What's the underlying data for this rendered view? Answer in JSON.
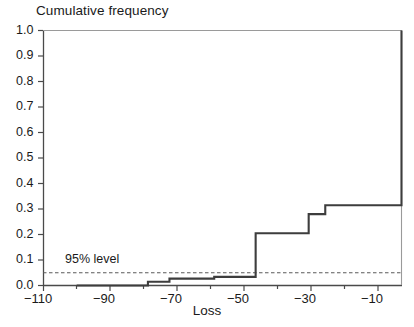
{
  "chart_data": {
    "type": "line",
    "subtype": "step",
    "title": "Cumulative frequency",
    "xlabel": "Loss",
    "ylabel": "Cumulative frequency",
    "xlim": [
      -110,
      -2
    ],
    "ylim": [
      0.0,
      1.0
    ],
    "grid": false,
    "legend": null,
    "x_ticks": [
      -110,
      -90,
      -70,
      -50,
      -30,
      -10
    ],
    "x_tick_labels": [
      "−110",
      "−90",
      "−70",
      "−50",
      "−30",
      "−10"
    ],
    "x_minor_ticks": [
      -100,
      -80,
      -60,
      -40,
      -20
    ],
    "y_ticks": [
      0.0,
      0.1,
      0.2,
      0.3,
      0.4,
      0.5,
      0.6,
      0.7,
      0.8,
      0.9,
      1.0
    ],
    "y_tick_labels": [
      "0.0",
      "0.1",
      "0.2",
      "0.3",
      "0.4",
      "0.5",
      "0.6",
      "0.7",
      "0.8",
      "0.9",
      "1.0"
    ],
    "series": [
      {
        "name": "Cumulative frequency",
        "color": "#3d3d3d",
        "steps_x": [
          -100.0,
          -78.5,
          -72.0,
          -58.5,
          -46.0,
          -30.0,
          -25.0,
          -2.0
        ],
        "steps_y": [
          0.0,
          0.015,
          0.027,
          0.034,
          0.205,
          0.28,
          0.315,
          1.0
        ],
        "points": [
          {
            "x": -100.0,
            "y": 0.0
          },
          {
            "x": -78.5,
            "y": 0.015
          },
          {
            "x": -72.0,
            "y": 0.027
          },
          {
            "x": -58.5,
            "y": 0.034
          },
          {
            "x": -46.0,
            "y": 0.205
          },
          {
            "x": -30.0,
            "y": 0.28
          },
          {
            "x": -25.0,
            "y": 0.315
          },
          {
            "x": -2.0,
            "y": 1.0
          }
        ]
      }
    ],
    "annotations": [
      {
        "name": "95-percent-level",
        "label": "95% level",
        "type": "horizontal-line",
        "y": 0.05,
        "style": "dashed",
        "color": "#5a5a5a"
      }
    ]
  },
  "axes": {
    "title": "Cumulative frequency",
    "x_title": "Loss",
    "level_label": "95% level"
  }
}
